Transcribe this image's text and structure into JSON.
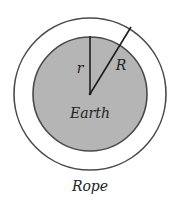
{
  "diagram": {
    "labels": {
      "inner_radius": "r",
      "outer_radius": "R",
      "inner_circle": "Earth",
      "outer_circle": "Rope"
    },
    "colors": {
      "earth_fill": "#b5b5b5",
      "stroke": "#4a4a4a",
      "line": "#1e1e1e",
      "background": "#ffffff"
    }
  }
}
